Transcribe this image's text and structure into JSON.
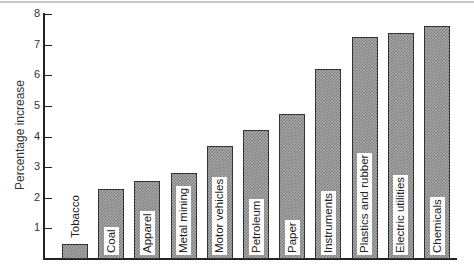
{
  "chart_data": {
    "type": "bar",
    "title": "",
    "xlabel": "",
    "ylabel": "Percentage increase",
    "ylim": [
      0,
      8
    ],
    "yticks": [
      1,
      2,
      3,
      4,
      5,
      6,
      7,
      8
    ],
    "grid": false,
    "legend": null,
    "categories": [
      "Tobacco",
      "Coal",
      "Apparel",
      "Metal mining",
      "Motor vehicles",
      "Petroleum",
      "Paper",
      "Instruments",
      "Plastics and rubber",
      "Electric utilities",
      "Chemicals"
    ],
    "values": [
      0.5,
      2.3,
      2.55,
      2.8,
      3.7,
      4.2,
      4.75,
      6.2,
      7.25,
      7.4,
      7.6
    ],
    "label_placement": "vertical text inside bar; Tobacco label above bar"
  },
  "axis": {
    "ylabel": "Percentage increase",
    "ticks": [
      "1",
      "2",
      "3",
      "4",
      "5",
      "6",
      "7",
      "8"
    ]
  },
  "bars": [
    {
      "label": "Tobacco",
      "value": 0.5
    },
    {
      "label": "Coal",
      "value": 2.3
    },
    {
      "label": "Apparel",
      "value": 2.55
    },
    {
      "label": "Metal mining",
      "value": 2.8
    },
    {
      "label": "Motor vehicles",
      "value": 3.7
    },
    {
      "label": "Petroleum",
      "value": 4.2
    },
    {
      "label": "Paper",
      "value": 4.75
    },
    {
      "label": "Instruments",
      "value": 6.2
    },
    {
      "label": "Plastics and rubber",
      "value": 7.25
    },
    {
      "label": "Electric utilities",
      "value": 7.4
    },
    {
      "label": "Chemicals",
      "value": 7.6
    }
  ]
}
